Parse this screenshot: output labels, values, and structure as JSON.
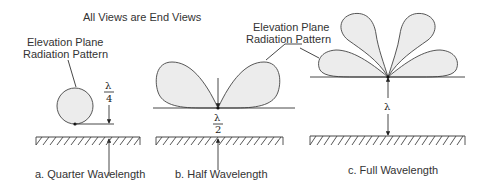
{
  "title": "All Views are End Views",
  "callout_label": {
    "line1": "Elevation Plane",
    "line2": "Radiation Pattern"
  },
  "panels": [
    {
      "id": "a",
      "caption": "a. Quarter Wavelength",
      "height_label": {
        "numerator": "λ",
        "denominator": "4"
      },
      "lobes": 1
    },
    {
      "id": "b",
      "caption": "b. Half Wavelength",
      "height_label": {
        "numerator": "λ",
        "denominator": "2"
      },
      "lobes": 2
    },
    {
      "id": "c",
      "caption": "c. Full Wavelength",
      "height_label": {
        "numerator": "λ"
      },
      "lobes": 4
    }
  ],
  "colors": {
    "lobe_fill": "#ececec",
    "stroke": "#444444",
    "text": "#333333"
  }
}
